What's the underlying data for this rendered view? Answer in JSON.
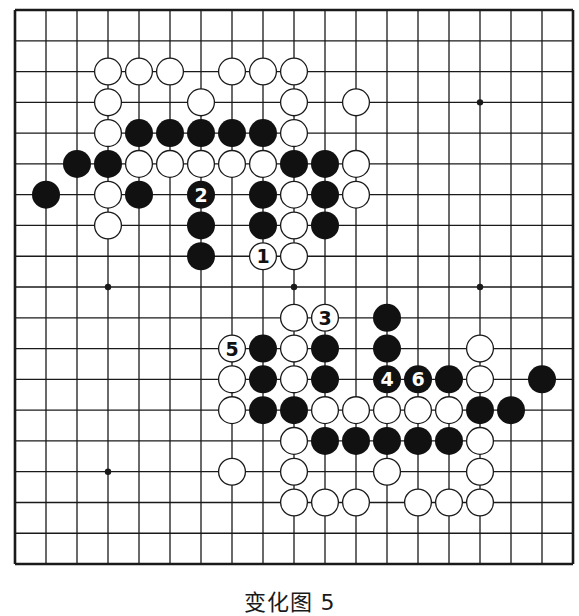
{
  "board": {
    "size": 19,
    "origin_x": 15,
    "origin_y": 10,
    "spacing_x": 31.0,
    "spacing_y": 30.78,
    "stone_radius": 14,
    "line_color": "#1a1a1a",
    "black_color": "#111111",
    "white_fill": "#ffffff",
    "hoshi": [
      [
        3,
        3
      ],
      [
        9,
        3
      ],
      [
        15,
        3
      ],
      [
        3,
        9
      ],
      [
        9,
        9
      ],
      [
        15,
        9
      ],
      [
        3,
        15
      ],
      [
        9,
        15
      ],
      [
        15,
        15
      ]
    ],
    "stones": [
      {
        "c": 3,
        "r": 2,
        "color": "W"
      },
      {
        "c": 4,
        "r": 2,
        "color": "W"
      },
      {
        "c": 5,
        "r": 2,
        "color": "W"
      },
      {
        "c": 7,
        "r": 2,
        "color": "W"
      },
      {
        "c": 8,
        "r": 2,
        "color": "W"
      },
      {
        "c": 9,
        "r": 2,
        "color": "W"
      },
      {
        "c": 3,
        "r": 3,
        "color": "W"
      },
      {
        "c": 6,
        "r": 3,
        "color": "W"
      },
      {
        "c": 9,
        "r": 3,
        "color": "W"
      },
      {
        "c": 11,
        "r": 3,
        "color": "W"
      },
      {
        "c": 3,
        "r": 4,
        "color": "W"
      },
      {
        "c": 4,
        "r": 4,
        "color": "B"
      },
      {
        "c": 5,
        "r": 4,
        "color": "B"
      },
      {
        "c": 6,
        "r": 4,
        "color": "B"
      },
      {
        "c": 7,
        "r": 4,
        "color": "B"
      },
      {
        "c": 8,
        "r": 4,
        "color": "B"
      },
      {
        "c": 9,
        "r": 4,
        "color": "W"
      },
      {
        "c": 2,
        "r": 5,
        "color": "B"
      },
      {
        "c": 3,
        "r": 5,
        "color": "B"
      },
      {
        "c": 4,
        "r": 5,
        "color": "W"
      },
      {
        "c": 5,
        "r": 5,
        "color": "W"
      },
      {
        "c": 6,
        "r": 5,
        "color": "W"
      },
      {
        "c": 7,
        "r": 5,
        "color": "W"
      },
      {
        "c": 8,
        "r": 5,
        "color": "W"
      },
      {
        "c": 9,
        "r": 5,
        "color": "B"
      },
      {
        "c": 10,
        "r": 5,
        "color": "B"
      },
      {
        "c": 11,
        "r": 5,
        "color": "W"
      },
      {
        "c": 1,
        "r": 6,
        "color": "B"
      },
      {
        "c": 3,
        "r": 6,
        "color": "W"
      },
      {
        "c": 4,
        "r": 6,
        "color": "B"
      },
      {
        "c": 6,
        "r": 6,
        "color": "B",
        "label": "2"
      },
      {
        "c": 8,
        "r": 6,
        "color": "B"
      },
      {
        "c": 9,
        "r": 6,
        "color": "W"
      },
      {
        "c": 10,
        "r": 6,
        "color": "B"
      },
      {
        "c": 11,
        "r": 6,
        "color": "W"
      },
      {
        "c": 3,
        "r": 7,
        "color": "W"
      },
      {
        "c": 6,
        "r": 7,
        "color": "B"
      },
      {
        "c": 8,
        "r": 7,
        "color": "B"
      },
      {
        "c": 9,
        "r": 7,
        "color": "W"
      },
      {
        "c": 10,
        "r": 7,
        "color": "B"
      },
      {
        "c": 6,
        "r": 8,
        "color": "B"
      },
      {
        "c": 8,
        "r": 8,
        "color": "W",
        "label": "1"
      },
      {
        "c": 9,
        "r": 8,
        "color": "W"
      },
      {
        "c": 9,
        "r": 10,
        "color": "W"
      },
      {
        "c": 10,
        "r": 10,
        "color": "W",
        "label": "3"
      },
      {
        "c": 12,
        "r": 10,
        "color": "B"
      },
      {
        "c": 7,
        "r": 11,
        "color": "W",
        "label": "5"
      },
      {
        "c": 8,
        "r": 11,
        "color": "B"
      },
      {
        "c": 9,
        "r": 11,
        "color": "W"
      },
      {
        "c": 10,
        "r": 11,
        "color": "B"
      },
      {
        "c": 12,
        "r": 11,
        "color": "B"
      },
      {
        "c": 15,
        "r": 11,
        "color": "W"
      },
      {
        "c": 7,
        "r": 12,
        "color": "W"
      },
      {
        "c": 8,
        "r": 12,
        "color": "B"
      },
      {
        "c": 9,
        "r": 12,
        "color": "W"
      },
      {
        "c": 10,
        "r": 12,
        "color": "B"
      },
      {
        "c": 12,
        "r": 12,
        "color": "B",
        "label": "4"
      },
      {
        "c": 13,
        "r": 12,
        "color": "B",
        "label": "6"
      },
      {
        "c": 14,
        "r": 12,
        "color": "B"
      },
      {
        "c": 15,
        "r": 12,
        "color": "W"
      },
      {
        "c": 17,
        "r": 12,
        "color": "B"
      },
      {
        "c": 7,
        "r": 13,
        "color": "W"
      },
      {
        "c": 8,
        "r": 13,
        "color": "B"
      },
      {
        "c": 9,
        "r": 13,
        "color": "B"
      },
      {
        "c": 10,
        "r": 13,
        "color": "W"
      },
      {
        "c": 11,
        "r": 13,
        "color": "W"
      },
      {
        "c": 12,
        "r": 13,
        "color": "W"
      },
      {
        "c": 13,
        "r": 13,
        "color": "W"
      },
      {
        "c": 14,
        "r": 13,
        "color": "W"
      },
      {
        "c": 15,
        "r": 13,
        "color": "B"
      },
      {
        "c": 16,
        "r": 13,
        "color": "B"
      },
      {
        "c": 9,
        "r": 14,
        "color": "W"
      },
      {
        "c": 10,
        "r": 14,
        "color": "B"
      },
      {
        "c": 11,
        "r": 14,
        "color": "B"
      },
      {
        "c": 12,
        "r": 14,
        "color": "B"
      },
      {
        "c": 13,
        "r": 14,
        "color": "B"
      },
      {
        "c": 14,
        "r": 14,
        "color": "B"
      },
      {
        "c": 15,
        "r": 14,
        "color": "W"
      },
      {
        "c": 7,
        "r": 15,
        "color": "W"
      },
      {
        "c": 9,
        "r": 15,
        "color": "W"
      },
      {
        "c": 12,
        "r": 15,
        "color": "W"
      },
      {
        "c": 15,
        "r": 15,
        "color": "W"
      },
      {
        "c": 9,
        "r": 16,
        "color": "W"
      },
      {
        "c": 10,
        "r": 16,
        "color": "W"
      },
      {
        "c": 11,
        "r": 16,
        "color": "W"
      },
      {
        "c": 13,
        "r": 16,
        "color": "W"
      },
      {
        "c": 14,
        "r": 16,
        "color": "W"
      },
      {
        "c": 15,
        "r": 16,
        "color": "W"
      }
    ]
  },
  "caption": "变化图 5"
}
